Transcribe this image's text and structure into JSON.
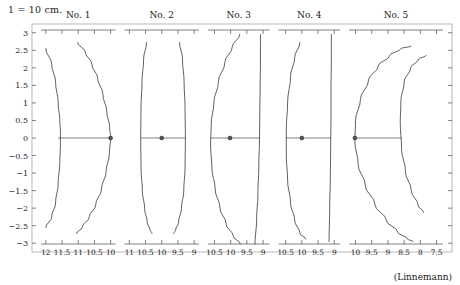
{
  "header": {
    "scale_note": "1 = 10 cm."
  },
  "credit": {
    "text": "(Linnemann)"
  },
  "chart_data": {
    "type": "line",
    "title": "1 = 10 cm.",
    "annotation": "(Linnemann)",
    "xlabel": "",
    "ylabel": "",
    "grid": false,
    "legend": "none",
    "shared_y": {
      "ylim": [
        -3.25,
        3.25
      ],
      "ticks": [
        3,
        2.5,
        2,
        1.5,
        1,
        0.5,
        0,
        -0.5,
        -1,
        -1.5,
        -2,
        -2.5,
        -3
      ],
      "tick_labels": [
        "3",
        "2.5",
        "2",
        "1.5",
        "1",
        "0.5",
        "0",
        "−0.5",
        "−1",
        "−1.5",
        "−2",
        "−2.5",
        "−3"
      ]
    },
    "panels": [
      {
        "label": "No. 1",
        "x_ticks": [
          12,
          11.5,
          11,
          10.5,
          10
        ],
        "x_tick_labels": [
          "12",
          "11.5",
          "11",
          "10.5",
          "10"
        ],
        "xlim": [
          12.15,
          9.85
        ],
        "x_direction": "decreasing",
        "axis_segment": {
          "y": 0,
          "x_start": 11.62,
          "x_end": 10.0
        },
        "marker": {
          "x": 10.0,
          "y": 0
        },
        "series": [
          {
            "name": "left-profile",
            "x": [
              12.0,
              11.82,
              11.7,
              11.62,
              11.57,
              11.55,
              11.55,
              11.57,
              11.62,
              11.7,
              11.82,
              12.0
            ],
            "y": [
              2.55,
              2.1,
              1.6,
              1.0,
              0.5,
              0.15,
              -0.2,
              -0.7,
              -1.3,
              -1.85,
              -2.25,
              -2.55
            ]
          },
          {
            "name": "right-profile",
            "x": [
              11.02,
              10.78,
              10.58,
              10.4,
              10.24,
              10.12,
              10.03,
              10.0,
              10.04,
              10.14,
              10.28,
              10.46,
              10.66,
              10.88,
              11.05
            ],
            "y": [
              2.72,
              2.45,
              2.1,
              1.7,
              1.25,
              0.75,
              0.3,
              0.0,
              -0.45,
              -0.95,
              -1.45,
              -1.9,
              -2.25,
              -2.55,
              -2.72
            ]
          }
        ]
      },
      {
        "label": "No. 2",
        "x_ticks": [
          11,
          10.5,
          10,
          9.5,
          9
        ],
        "x_tick_labels": [
          "11",
          "10.5",
          "10",
          "9.5",
          "9"
        ],
        "xlim": [
          11.15,
          8.85
        ],
        "x_direction": "decreasing",
        "axis_segment": {
          "y": 0,
          "x_start": 10.64,
          "x_end": 9.28
        },
        "marker": {
          "x": 10.0,
          "y": 0
        },
        "series": [
          {
            "name": "left-profile",
            "x": [
              10.47,
              10.56,
              10.61,
              10.64,
              10.65,
              10.64,
              10.6,
              10.53,
              10.45,
              10.36,
              10.3
            ],
            "y": [
              2.72,
              2.25,
              1.6,
              0.85,
              0.0,
              -0.85,
              -1.5,
              -2.0,
              -2.4,
              -2.62,
              -2.72
            ]
          },
          {
            "name": "right-profile",
            "x": [
              9.45,
              9.36,
              9.31,
              9.28,
              9.27,
              9.28,
              9.32,
              9.39,
              9.48,
              9.57,
              9.63
            ],
            "y": [
              2.72,
              2.25,
              1.6,
              0.85,
              0.0,
              -0.85,
              -1.5,
              -2.0,
              -2.4,
              -2.62,
              -2.72
            ]
          }
        ]
      },
      {
        "label": "No. 3",
        "x_ticks": [
          10.5,
          10,
          9.5,
          9
        ],
        "x_tick_labels": [
          "10.5",
          "10",
          "9.5",
          "9"
        ],
        "xlim": [
          10.7,
          8.8
        ],
        "x_direction": "decreasing",
        "axis_segment": {
          "y": 0,
          "x_start": 10.62,
          "x_end": 9.1
        },
        "marker": {
          "x": 10.02,
          "y": 0
        },
        "series": [
          {
            "name": "left-arc",
            "x": [
              9.72,
              9.95,
              10.18,
              10.38,
              10.52,
              10.6,
              10.62,
              10.58,
              10.48,
              10.33,
              10.14,
              9.92,
              9.7
            ],
            "y": [
              2.95,
              2.6,
              2.15,
              1.6,
              1.0,
              0.4,
              -0.2,
              -0.85,
              -1.45,
              -2.0,
              -2.45,
              -2.8,
              -3.02
            ]
          },
          {
            "name": "right-line",
            "x": [
              9.08,
              9.08,
              9.09,
              9.1,
              9.11,
              9.13,
              9.16,
              9.2,
              9.25
            ],
            "y": [
              2.95,
              2.25,
              1.5,
              0.75,
              0.0,
              -0.8,
              -1.6,
              -2.35,
              -3.02
            ]
          }
        ]
      },
      {
        "label": "No. 4",
        "x_ticks": [
          10.5,
          10,
          9.5,
          9
        ],
        "x_tick_labels": [
          "10.5",
          "10",
          "9.5",
          "9"
        ],
        "xlim": [
          10.72,
          8.82
        ],
        "x_direction": "decreasing",
        "axis_segment": {
          "y": 0,
          "x_start": 10.48,
          "x_end": 9.1
        },
        "marker": {
          "x": 10.0,
          "y": 0
        },
        "series": [
          {
            "name": "left-arc",
            "x": [
              10.06,
              10.22,
              10.35,
              10.44,
              10.48,
              10.48,
              10.44,
              10.35,
              10.22,
              10.06,
              9.88
            ],
            "y": [
              2.72,
              2.3,
              1.75,
              1.0,
              0.25,
              -0.5,
              -1.2,
              -1.85,
              -2.35,
              -2.72,
              -2.88
            ]
          },
          {
            "name": "right-line",
            "x": [
              9.09,
              9.09,
              9.1,
              9.1,
              9.11,
              9.12,
              9.14,
              9.16
            ],
            "y": [
              2.95,
              2.2,
              1.4,
              0.6,
              -0.2,
              -1.1,
              -2.0,
              -2.95
            ]
          }
        ]
      },
      {
        "label": "No. 5",
        "x_ticks": [
          10,
          9.5,
          9,
          8.5,
          8,
          7.5
        ],
        "x_tick_labels": [
          "10",
          "9.5",
          "9",
          "8.5",
          "8",
          "7.5"
        ],
        "xlim": [
          10.2,
          7.3
        ],
        "x_direction": "decreasing",
        "axis_segment": {
          "y": 0,
          "x_start": 10.02,
          "x_end": 8.58
        },
        "marker": {
          "x": 10.02,
          "y": 0
        },
        "series": [
          {
            "name": "outer-arc",
            "x": [
              8.28,
              8.6,
              8.95,
              9.3,
              9.6,
              9.85,
              10.0,
              10.02,
              9.92,
              9.7,
              9.4,
              9.05,
              8.7,
              8.4,
              8.22
            ],
            "y": [
              2.62,
              2.55,
              2.35,
              2.05,
              1.65,
              1.1,
              0.5,
              -0.1,
              -0.75,
              -1.35,
              -1.9,
              -2.35,
              -2.68,
              -2.88,
              -2.95
            ]
          },
          {
            "name": "inner-arc",
            "x": [
              7.82,
              8.05,
              8.3,
              8.5,
              8.6,
              8.62,
              8.58,
              8.46,
              8.28,
              8.07,
              7.9
            ],
            "y": [
              2.35,
              2.25,
              2.0,
              1.6,
              1.05,
              0.45,
              -0.3,
              -0.95,
              -1.5,
              -1.92,
              -2.12
            ]
          }
        ]
      }
    ]
  }
}
